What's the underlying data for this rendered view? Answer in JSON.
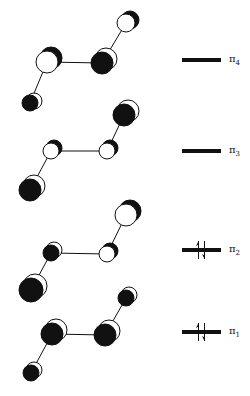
{
  "colors": {
    "phase_positive": "#ffffff",
    "phase_negative": "#111111",
    "stroke": "#111111"
  },
  "orbitals": [
    {
      "name": "pi4",
      "symbol": "π",
      "index": "4",
      "occupied": false,
      "electrons": 0,
      "level_y": 60,
      "atoms": [
        {
          "x": 30,
          "y": 103,
          "r": 8,
          "front": "black",
          "dx": 4,
          "dy": -2
        },
        {
          "x": 47,
          "y": 62,
          "r": 11,
          "front": "white",
          "dx": 4,
          "dy": -4
        },
        {
          "x": 102,
          "y": 63,
          "r": 11,
          "front": "black",
          "dx": 4,
          "dy": -4
        },
        {
          "x": 126,
          "y": 23,
          "r": 9,
          "front": "white",
          "dx": 4,
          "dy": -3
        }
      ]
    },
    {
      "name": "pi3",
      "symbol": "π",
      "index": "3",
      "occupied": false,
      "electrons": 0,
      "level_y": 151,
      "atoms": [
        {
          "x": 30,
          "y": 190,
          "r": 11,
          "front": "black",
          "dx": 4,
          "dy": -4
        },
        {
          "x": 51,
          "y": 151,
          "r": 8,
          "front": "white",
          "dx": 3,
          "dy": -3
        },
        {
          "x": 107,
          "y": 151,
          "r": 8,
          "front": "white",
          "dx": 3,
          "dy": -3
        },
        {
          "x": 124,
          "y": 115,
          "r": 11,
          "front": "black",
          "dx": 4,
          "dy": -4
        }
      ]
    },
    {
      "name": "pi2",
      "symbol": "π",
      "index": "2",
      "occupied": true,
      "electrons": 2,
      "level_y": 250,
      "atoms": [
        {
          "x": 31,
          "y": 290,
          "r": 12,
          "front": "black",
          "dx": 4,
          "dy": -4
        },
        {
          "x": 51,
          "y": 253,
          "r": 8,
          "front": "black",
          "dx": 3,
          "dy": -3
        },
        {
          "x": 107,
          "y": 254,
          "r": 8,
          "front": "white",
          "dx": 3,
          "dy": -3
        },
        {
          "x": 126,
          "y": 215,
          "r": 11,
          "front": "white",
          "dx": 4,
          "dy": -4
        }
      ]
    },
    {
      "name": "pi1",
      "symbol": "π",
      "index": "1",
      "occupied": true,
      "electrons": 2,
      "level_y": 332,
      "atoms": [
        {
          "x": 31,
          "y": 373,
          "r": 8,
          "front": "black",
          "dx": 3,
          "dy": -3
        },
        {
          "x": 52,
          "y": 334,
          "r": 11,
          "front": "black",
          "dx": 4,
          "dy": -4
        },
        {
          "x": 105,
          "y": 335,
          "r": 11,
          "front": "black",
          "dx": 4,
          "dy": -4
        },
        {
          "x": 126,
          "y": 298,
          "r": 8,
          "front": "black",
          "dx": 3,
          "dy": -3
        }
      ]
    }
  ],
  "level_bar": {
    "x1": 182,
    "x2": 221,
    "thickness": 4
  },
  "labels": [
    {
      "symbol": "π",
      "sub": "4",
      "x": 229,
      "y": 53
    },
    {
      "symbol": "π",
      "sub": "3",
      "x": 229,
      "y": 144
    },
    {
      "symbol": "π",
      "sub": "2",
      "x": 229,
      "y": 243
    },
    {
      "symbol": "π",
      "sub": "1",
      "x": 229,
      "y": 325
    }
  ]
}
